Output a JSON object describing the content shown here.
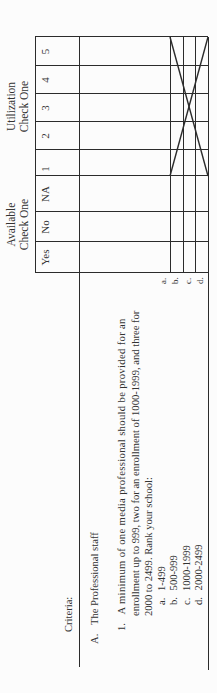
{
  "header": {
    "available_group": {
      "line1": "Available",
      "line2": "Check One"
    },
    "utilization_group": {
      "line1": "Utilization",
      "line2": "Check One"
    },
    "available_columns": [
      "Yes",
      "No",
      "NA"
    ],
    "utilization_columns": [
      "1",
      "2",
      "3",
      "4",
      "5"
    ]
  },
  "criteria": {
    "heading": "Criteria:",
    "section": {
      "letter": "A.",
      "title": "The Professional staff"
    },
    "item": {
      "number": "1.",
      "lines": [
        "A minimum of one media professional should be provided for an",
        "enrollment up to 999, two for an enrollment of 1000-1999, and three for",
        "2000 to 2499. Rank your school:"
      ],
      "options": [
        {
          "letter": "a.",
          "label": "1-499"
        },
        {
          "letter": "b.",
          "label": "500-999"
        },
        {
          "letter": "c.",
          "label": "1000-1999"
        },
        {
          "letter": "d.",
          "label": "2000-2499"
        }
      ]
    }
  },
  "row_letters": [
    "a.",
    "b.",
    "c.",
    "d."
  ],
  "colors": {
    "ink": "#2b2b2b",
    "paper": "#fcfcfc"
  }
}
